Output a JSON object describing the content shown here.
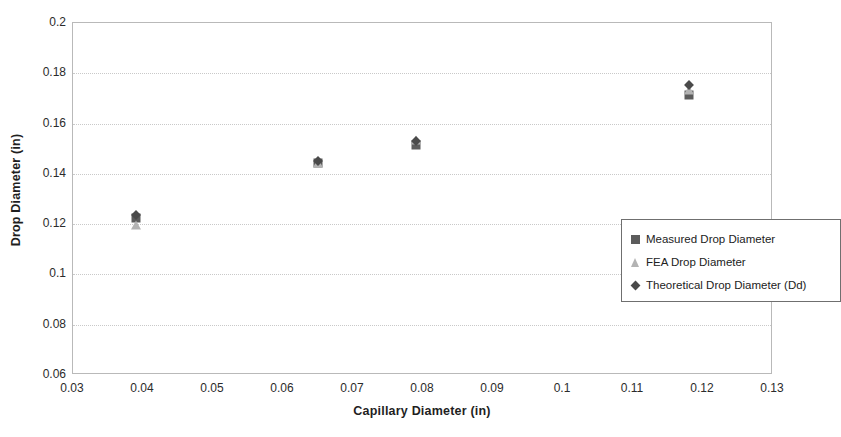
{
  "chart_data": {
    "type": "scatter",
    "title": "",
    "xlabel": "Capillary Diameter (in)",
    "ylabel": "Drop Diameter (in)",
    "xlim": [
      0.03,
      0.13
    ],
    "ylim": [
      0.06,
      0.2
    ],
    "xticks": [
      "0.03",
      "0.04",
      "0.05",
      "0.06",
      "0.07",
      "0.08",
      "0.09",
      "0.1",
      "0.11",
      "0.12",
      "0.13"
    ],
    "xtick_values": [
      0.03,
      0.04,
      0.05,
      0.06,
      0.07,
      0.08,
      0.09,
      0.1,
      0.11,
      0.12,
      0.13
    ],
    "yticks": [
      "0.06",
      "0.08",
      "0.1",
      "0.12",
      "0.14",
      "0.16",
      "0.18",
      "0.2"
    ],
    "ytick_values": [
      0.06,
      0.08,
      0.1,
      0.12,
      0.14,
      0.16,
      0.18,
      0.2
    ],
    "grid": "horizontal",
    "legend_position": "inside-right-middle",
    "series": [
      {
        "name": "Measured Drop Diameter",
        "marker": "square",
        "color": "#5c5c5c",
        "x": [
          0.039,
          0.065,
          0.079,
          0.118
        ],
        "y": [
          0.1225,
          0.1445,
          0.1515,
          0.1715
        ]
      },
      {
        "name": "FEA Drop Diameter",
        "marker": "triangle",
        "color": "#b3b3b3",
        "x": [
          0.039,
          0.065,
          0.079,
          0.118
        ],
        "y": [
          0.1195,
          0.1445,
          0.1535,
          0.1735
        ]
      },
      {
        "name": "Theoretical Drop Diameter (Dd)",
        "marker": "diamond",
        "color": "#4a4a4a",
        "x": [
          0.039,
          0.065,
          0.079,
          0.118
        ],
        "y": [
          0.1235,
          0.145,
          0.153,
          0.1755
        ]
      }
    ]
  },
  "legend": {
    "items": [
      {
        "label": "Measured Drop Diameter",
        "marker": "square"
      },
      {
        "label": "FEA Drop Diameter",
        "marker": "triangle"
      },
      {
        "label": "Theoretical Drop Diameter (Dd)",
        "marker": "diamond"
      }
    ]
  },
  "axes": {
    "y_title": "Drop Diameter (in)",
    "x_title": "Capillary Diameter (in)"
  },
  "colors": {
    "measured": "#5c5c5c",
    "fea": "#b3b3b3",
    "theoretical": "#4a4a4a",
    "gridline": "#c9c9c9",
    "axis": "#b9b9b9"
  }
}
